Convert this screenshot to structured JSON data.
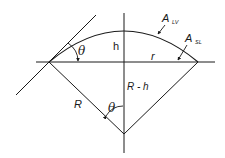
{
  "diagram": {
    "colors": {
      "stroke": "#1a1a1a",
      "background": "#ffffff"
    },
    "labels": {
      "contact_angle_top": "θ",
      "contact_angle_bottom": "θ",
      "height": "h",
      "radius_base": "r",
      "sphere_radius": "R",
      "center_offset": "R - h",
      "area_lv_main": "A",
      "area_lv_sub": "LV",
      "area_sl_main": "A",
      "area_sl_sub": "SL"
    }
  }
}
